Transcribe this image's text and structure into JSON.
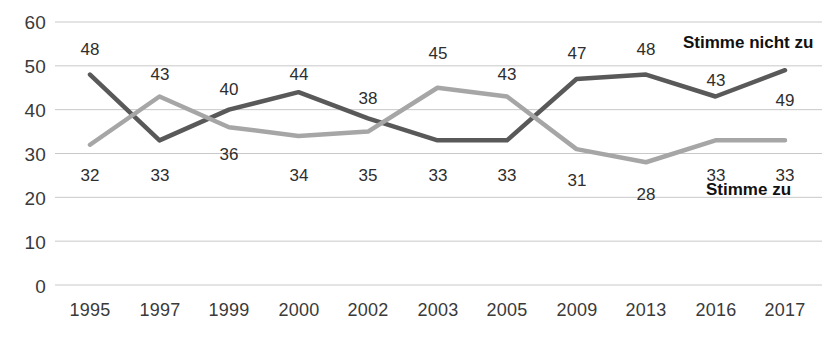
{
  "chart_data": {
    "type": "line",
    "title": "",
    "xlabel": "",
    "ylabel": "",
    "categories": [
      "1995",
      "1997",
      "1999",
      "2000",
      "2002",
      "2003",
      "2005",
      "2009",
      "2013",
      "2016",
      "2017"
    ],
    "ylim": [
      0,
      60
    ],
    "yticks": [
      0,
      10,
      20,
      30,
      40,
      50,
      60
    ],
    "grid": true,
    "legend_position": "right-inline",
    "series": [
      {
        "name": "Stimme nicht zu",
        "color": "#595959",
        "values": [
          48,
          33,
          40,
          44,
          38,
          33,
          33,
          47,
          48,
          43,
          49
        ]
      },
      {
        "name": "Stimme zu",
        "color": "#a6a6a6",
        "values": [
          32,
          43,
          36,
          34,
          35,
          45,
          43,
          31,
          28,
          33,
          33
        ]
      }
    ]
  },
  "axis": {
    "y_labels": [
      "60",
      "50",
      "40",
      "30",
      "20",
      "10",
      "0"
    ],
    "x_labels": [
      "1995",
      "1997",
      "1999",
      "2000",
      "2002",
      "2003",
      "2005",
      "2009",
      "2013",
      "2016",
      "2017"
    ]
  },
  "labels": {
    "upper": [
      "48",
      "43",
      "40",
      "44",
      "38",
      "45",
      "43",
      "47",
      "48",
      "43",
      "49"
    ],
    "lower": [
      "32",
      "33",
      "36",
      "34",
      "35",
      "33",
      "33",
      "31",
      "28",
      "33",
      "33"
    ]
  },
  "legend": {
    "upper_label": "Stimme nicht zu",
    "lower_label": "Stimme zu"
  },
  "colors": {
    "dark_series": "#595959",
    "light_series": "#a6a6a6",
    "gridline": "#c8c8c8",
    "text": "#3a3a3a"
  }
}
